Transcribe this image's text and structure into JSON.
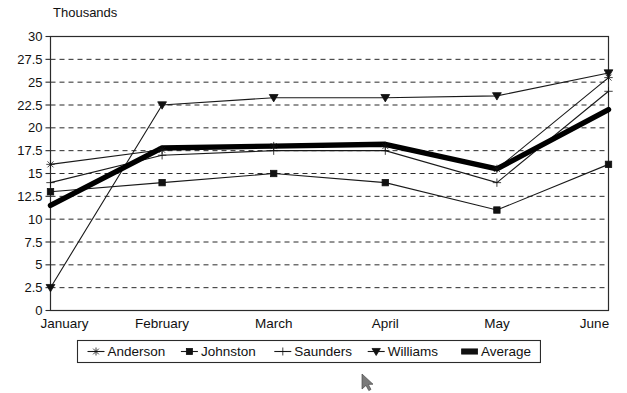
{
  "chart_data": {
    "type": "line",
    "title": "",
    "ylabel": "Thousands",
    "xlabel": "",
    "categories": [
      "January",
      "February",
      "March",
      "April",
      "May",
      "June"
    ],
    "ylim": [
      0,
      30
    ],
    "ytick_values": [
      0,
      2.5,
      5,
      7.5,
      10,
      12.5,
      15,
      17.5,
      20,
      22.5,
      25,
      27.5,
      30
    ],
    "ytick_labels": [
      "0",
      "2.5",
      "5",
      "7.5",
      "10",
      "12.5",
      "15",
      "17.5",
      "20",
      "22.5",
      "25",
      "27.5",
      "30"
    ],
    "grid": true,
    "grid_style": "horizontal-dashed",
    "legend_position": "bottom",
    "series": [
      {
        "name": "Anderson",
        "marker": "star",
        "values": [
          16,
          17.6,
          18,
          18,
          15.5,
          25.5
        ]
      },
      {
        "name": "Johnston",
        "marker": "square",
        "values": [
          13,
          14,
          15,
          14,
          11,
          16
        ]
      },
      {
        "name": "Saunders",
        "marker": "plus",
        "values": [
          14,
          17,
          17.5,
          17.5,
          14,
          24
        ]
      },
      {
        "name": "Williams",
        "marker": "triangle-down",
        "values": [
          2.5,
          22.5,
          23.3,
          23.3,
          23.5,
          26
        ]
      },
      {
        "name": "Average",
        "marker": "none",
        "values": [
          11.5,
          17.8,
          18,
          18.2,
          15.5,
          22
        ]
      }
    ]
  },
  "legend": {
    "entries": [
      {
        "label": "Anderson",
        "marker": "star"
      },
      {
        "label": "Johnston",
        "marker": "square"
      },
      {
        "label": "Saunders",
        "marker": "plus"
      },
      {
        "label": "Williams",
        "marker": "triangle-down"
      },
      {
        "label": "Average",
        "marker": "thick-bar"
      }
    ]
  },
  "colors": {
    "foreground": "#1a1a1a",
    "background": "#ffffff",
    "grid": "#2b2b2b",
    "average_series": "#000000"
  },
  "cursor": {
    "icon": "mouse-pointer"
  }
}
